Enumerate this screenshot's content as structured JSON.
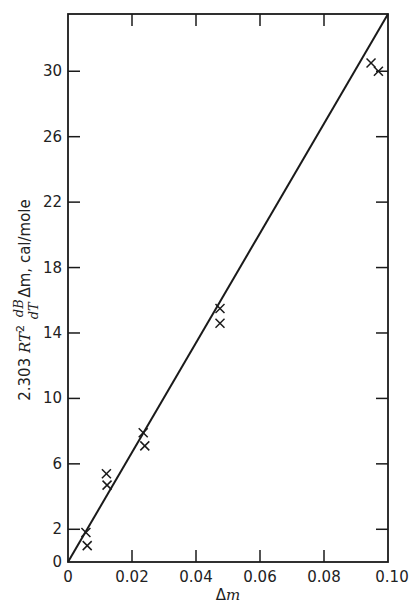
{
  "chart_data": {
    "type": "scatter",
    "title": "",
    "xlabel": "Δm",
    "ylabel": "2.303 RT² (dB/dT) Δm, cal/mole",
    "xlim": [
      0,
      0.1
    ],
    "ylim": [
      0,
      33.5
    ],
    "x_ticks": [
      "0",
      "0.02",
      "0.04",
      "0.06",
      "0.08",
      "0.10"
    ],
    "x_tick_values": [
      0,
      0.02,
      0.04,
      0.06,
      0.08,
      0.1
    ],
    "y_ticks": [
      "0",
      "2",
      "6",
      "10",
      "14",
      "18",
      "22",
      "26",
      "30"
    ],
    "y_tick_values": [
      0,
      2,
      6,
      10,
      14,
      18,
      22,
      26,
      30
    ],
    "grid": false,
    "legend": null,
    "series": [
      {
        "name": "measured",
        "marker": "x",
        "points": [
          {
            "x": 0.0056,
            "y": 1.8
          },
          {
            "x": 0.006,
            "y": 1.0
          },
          {
            "x": 0.012,
            "y": 5.4
          },
          {
            "x": 0.0122,
            "y": 4.7
          },
          {
            "x": 0.0235,
            "y": 7.9
          },
          {
            "x": 0.024,
            "y": 7.1
          },
          {
            "x": 0.0475,
            "y": 15.5
          },
          {
            "x": 0.0475,
            "y": 14.6
          },
          {
            "x": 0.0947,
            "y": 30.5
          },
          {
            "x": 0.097,
            "y": 30.0
          }
        ]
      },
      {
        "name": "fit line",
        "type": "line",
        "points": [
          {
            "x": 0,
            "y": 0
          },
          {
            "x": 0.1,
            "y": 33.5
          }
        ]
      }
    ]
  },
  "labels": {
    "ylabel_prefix": "2.303 ",
    "ylabel_RT": "RT",
    "ylabel_sup": "2",
    "ylabel_dB": "dB",
    "ylabel_dT": "dT",
    "ylabel_dm": " Δm,",
    "ylabel_units": "  cal/mole",
    "xlabel_delta": "Δ",
    "xlabel_m": "m"
  },
  "colors": {
    "ink": "#1a1a1a",
    "background": "#ffffff"
  }
}
